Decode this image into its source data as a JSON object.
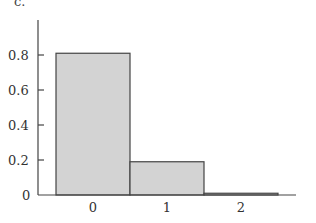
{
  "panel_label": "c.",
  "chart_data": {
    "type": "bar",
    "title": "",
    "xlabel": "",
    "ylabel": "",
    "categories": [
      "0",
      "1",
      "2"
    ],
    "values": [
      0.81,
      0.19,
      0.01
    ],
    "ylim": [
      0,
      1.0
    ],
    "yticks": [
      0,
      0.2,
      0.4,
      0.6,
      0.8
    ],
    "ytick_labels": [
      "0",
      "0.2",
      "0.4",
      "0.6",
      "0.8"
    ],
    "grid": false,
    "legend": null,
    "bar_color": "#d3d3d3",
    "edge_color": "#444444"
  }
}
